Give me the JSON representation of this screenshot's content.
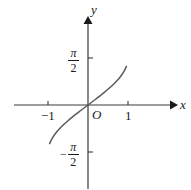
{
  "figure": {
    "background_color": "#ffffff",
    "ink_color": "#3a3a3a",
    "text_color": "#1a1a1a"
  },
  "labels": {
    "x_axis": "x",
    "y_axis": "y",
    "origin": "O",
    "x_tick_neg1": "−1",
    "x_tick_pos1": "1",
    "y_tick_pos_numerator": "π",
    "y_tick_pos_denominator": "2",
    "y_tick_pos_sign": "",
    "y_tick_neg_numerator": "π",
    "y_tick_neg_denominator": "2",
    "y_tick_neg_sign": "−"
  },
  "chart_data": {
    "type": "line",
    "title": "",
    "subtitle": "",
    "xlabel": "x",
    "ylabel": "y",
    "xlim": [
      -1.45,
      1.45
    ],
    "ylim": [
      -2.05,
      2.05
    ],
    "grid": false,
    "legend": null,
    "legend_position": "none",
    "xticks": [
      -1,
      1
    ],
    "xtick_labels": [
      "−1",
      "1"
    ],
    "yticks": [
      1.5708,
      -1.5708
    ],
    "ytick_labels": [
      "π/2",
      "−π/2"
    ],
    "annotations": [
      {
        "text": "O",
        "x": 0,
        "y": 0,
        "note": "origin label, placed below-right of origin"
      }
    ],
    "series": [
      {
        "name": "y = arcsin(x)",
        "color": "#5a5a5a",
        "x": [
          -0.96,
          -0.9,
          -0.8,
          -0.7,
          -0.6,
          -0.5,
          -0.4,
          -0.3,
          -0.2,
          -0.1,
          0.0,
          0.1,
          0.2,
          0.3,
          0.4,
          0.5,
          0.6,
          0.7,
          0.8,
          0.9,
          0.96
        ],
        "y": [
          -1.287,
          -1.12,
          -0.927,
          -0.775,
          -0.644,
          -0.524,
          -0.412,
          -0.305,
          -0.201,
          -0.1,
          0.0,
          0.1,
          0.201,
          0.305,
          0.412,
          0.524,
          0.644,
          0.775,
          0.927,
          1.12,
          1.287
        ]
      }
    ]
  },
  "geometry": {
    "origin_px": {
      "x": 88,
      "y": 105
    },
    "x_unit_px": 40,
    "y_unit_px": 30,
    "x_axis_start_px": 14,
    "x_axis_end_px": 174,
    "y_axis_top_px": 17,
    "y_axis_bottom_px": 189
  }
}
